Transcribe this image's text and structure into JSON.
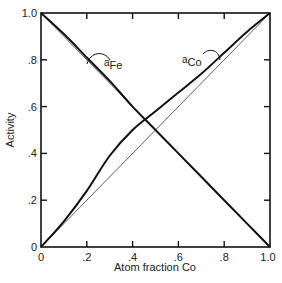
{
  "chart_data": {
    "type": "line",
    "title": "",
    "xlabel": "Atom fraction Co",
    "ylabel": "Activity",
    "xlim": [
      0,
      1.0
    ],
    "ylim": [
      0,
      1.0
    ],
    "grid": false,
    "x_ticks": [
      "0",
      ".2",
      ".4",
      ".6",
      ".8",
      "1.0"
    ],
    "y_ticks": [
      "0",
      ".2",
      ".4",
      ".6",
      ".8",
      "1.0"
    ],
    "x": [
      0,
      0.1,
      0.2,
      0.3,
      0.4,
      0.5,
      0.6,
      0.7,
      0.8,
      0.9,
      1.0
    ],
    "series": [
      {
        "name": "a_Co",
        "label_main": "a",
        "label_sub": "Co",
        "values": [
          0,
          0.11,
          0.24,
          0.39,
          0.5,
          0.58,
          0.66,
          0.74,
          0.83,
          0.92,
          1.0
        ]
      },
      {
        "name": "a_Fe",
        "label_main": "a",
        "label_sub": "Fe",
        "values": [
          1.0,
          0.91,
          0.81,
          0.71,
          0.6,
          0.5,
          0.4,
          0.3,
          0.2,
          0.1,
          0
        ]
      },
      {
        "name": "Raoult ideal Co",
        "values": [
          0,
          0.1,
          0.2,
          0.3,
          0.4,
          0.5,
          0.6,
          0.7,
          0.8,
          0.9,
          1.0
        ]
      },
      {
        "name": "Raoult ideal Fe",
        "values": [
          1.0,
          0.9,
          0.8,
          0.7,
          0.6,
          0.5,
          0.4,
          0.3,
          0.2,
          0.1,
          0
        ]
      }
    ],
    "annotations": [
      "aFe",
      "aCo"
    ]
  }
}
